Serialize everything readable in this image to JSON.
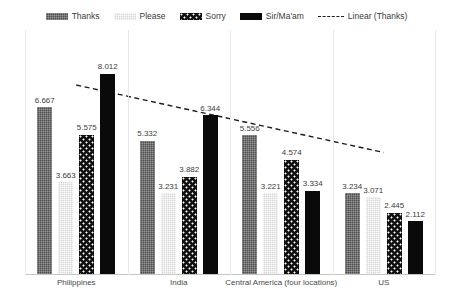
{
  "legend": {
    "position": "top-center",
    "entries": [
      {
        "label": "Thanks",
        "swatch": "fill-thanks",
        "kind": "bar",
        "color": "#4e4e4e"
      },
      {
        "label": "Please",
        "swatch": "fill-please",
        "kind": "bar",
        "color": "#d9d9d9"
      },
      {
        "label": "Sorry",
        "swatch": "fill-sorry",
        "kind": "bar",
        "color": "#111111"
      },
      {
        "label": "Sir/Ma'am",
        "swatch": "fill-sirmaam",
        "kind": "bar",
        "color": "#0a0a0a"
      },
      {
        "label": "Linear (Thanks)",
        "swatch": "",
        "kind": "line",
        "color": "#1c1c1c"
      }
    ]
  },
  "chart_data": {
    "type": "bar",
    "title": "",
    "subtitle": "",
    "xlabel": "",
    "ylabel": "",
    "ylim": [
      0,
      9
    ],
    "grid": false,
    "legend_position": "top-center",
    "categories": [
      "Philippines",
      "India",
      "Central America (four locations)",
      "US"
    ],
    "series": [
      {
        "name": "Thanks",
        "color": "#4e4e4e",
        "pattern": "fine-grid",
        "values": [
          6.667,
          5.332,
          5.556,
          3.234
        ]
      },
      {
        "name": "Please",
        "color": "#d9d9d9",
        "pattern": "fine-grid",
        "values": [
          3.663,
          3.231,
          3.221,
          3.071
        ]
      },
      {
        "name": "Sorry",
        "color": "#111111",
        "pattern": "polka-dots",
        "values": [
          5.575,
          3.882,
          4.574,
          2.445
        ]
      },
      {
        "name": "Sir/Ma'am",
        "color": "#0a0a0a",
        "pattern": "solid",
        "values": [
          8.012,
          6.344,
          3.334,
          2.112
        ]
      }
    ],
    "value_labels": [
      [
        "6.667",
        "3.663",
        "5.575",
        "8.012"
      ],
      [
        "5.332",
        "3.231",
        "3.882",
        "6.344"
      ],
      [
        "5.556",
        "3.221",
        "4.574",
        "3.334"
      ],
      [
        "3.234",
        "3.071",
        "2.445",
        "2.112"
      ]
    ],
    "trendline": {
      "name": "Linear (Thanks)",
      "style": "dashed",
      "color": "#1c1c1c",
      "of_series": "Thanks",
      "start": {
        "x_category_index": 0,
        "y": 6.8
      },
      "end": {
        "x_category_index": 3,
        "y": 4.1
      }
    }
  }
}
